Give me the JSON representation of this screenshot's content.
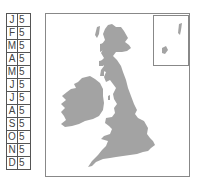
{
  "calendar": {
    "rows": [
      {
        "month": "J",
        "value": "5"
      },
      {
        "month": "F",
        "value": "5"
      },
      {
        "month": "M",
        "value": "5"
      },
      {
        "month": "A",
        "value": "5"
      },
      {
        "month": "M",
        "value": "5"
      },
      {
        "month": "J",
        "value": "5"
      },
      {
        "month": "J",
        "value": "5"
      },
      {
        "month": "A",
        "value": "5"
      },
      {
        "month": "S",
        "value": "5"
      },
      {
        "month": "O",
        "value": "5"
      },
      {
        "month": "N",
        "value": "5"
      },
      {
        "month": "D",
        "value": "5"
      }
    ]
  },
  "map": {
    "region": "British Isles",
    "land_color": "#a3a3a3",
    "inset": "Shetland Islands"
  }
}
